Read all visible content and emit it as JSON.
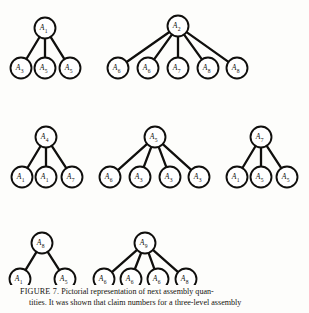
{
  "figure": {
    "label": "FIGURE 7.",
    "caption_line_1": "Pictorial representation of next assembly quan-",
    "caption_line_2": "tities. It was shown that claim numbers for a three-level assembly",
    "caption_full": "FIGURE 7. Pictorial representation of next assembly quantities. It was shown that claim numbers for a three-level assembly"
  },
  "diagram": {
    "type": "tree-forest",
    "node_prefix": "A",
    "trees": [
      {
        "id": "tree-1",
        "root": {
          "label": "A",
          "sub": "1"
        },
        "children": [
          {
            "label": "A",
            "sub": "3"
          },
          {
            "label": "A",
            "sub": "5"
          },
          {
            "label": "A",
            "sub": "5"
          }
        ]
      },
      {
        "id": "tree-2",
        "root": {
          "label": "A",
          "sub": "2"
        },
        "children": [
          {
            "label": "A",
            "sub": "6"
          },
          {
            "label": "A",
            "sub": "6"
          },
          {
            "label": "A",
            "sub": "7"
          },
          {
            "label": "A",
            "sub": "8"
          },
          {
            "label": "A",
            "sub": "8"
          }
        ]
      },
      {
        "id": "tree-3",
        "root": {
          "label": "A",
          "sub": "4"
        },
        "children": [
          {
            "label": "A",
            "sub": "1"
          },
          {
            "label": "A",
            "sub": "1"
          },
          {
            "label": "A",
            "sub": "7"
          }
        ]
      },
      {
        "id": "tree-4",
        "root": {
          "label": "A",
          "sub": "5"
        },
        "children": [
          {
            "label": "A",
            "sub": "6"
          },
          {
            "label": "A",
            "sub": "3"
          },
          {
            "label": "A",
            "sub": "3"
          },
          {
            "label": "A",
            "sub": "3"
          }
        ]
      },
      {
        "id": "tree-5",
        "root": {
          "label": "A",
          "sub": "7"
        },
        "children": [
          {
            "label": "A",
            "sub": "1"
          },
          {
            "label": "A",
            "sub": "5"
          },
          {
            "label": "A",
            "sub": "5"
          }
        ]
      },
      {
        "id": "tree-6",
        "root": {
          "label": "A",
          "sub": "8"
        },
        "children": [
          {
            "label": "A",
            "sub": "1"
          },
          {
            "label": "A",
            "sub": "5"
          }
        ]
      },
      {
        "id": "tree-7",
        "root": {
          "label": "A",
          "sub": "9"
        },
        "children": [
          {
            "label": "A",
            "sub": "6"
          },
          {
            "label": "A",
            "sub": "6"
          },
          {
            "label": "A",
            "sub": "6"
          },
          {
            "label": "A",
            "sub": "8"
          }
        ]
      }
    ]
  },
  "style": {
    "ink": "#100f0d",
    "paper": "#fdfdfb",
    "node_fill": "#ffffff",
    "node_radius": 10.5,
    "row_y_root": [
      28,
      137,
      243
    ],
    "row_y_leaf": [
      68,
      177,
      279
    ]
  }
}
